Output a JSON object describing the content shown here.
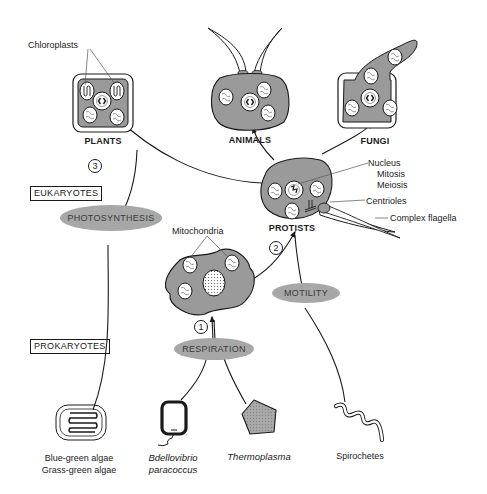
{
  "kingdoms": {
    "plants": "PLANTS",
    "animals": "ANIMALS",
    "fungi": "FUNGI",
    "protists": "PROTISTS"
  },
  "domains": {
    "eukaryotes": "EUKARYOTES",
    "prokaryotes": "PROKARYOTES"
  },
  "processes": {
    "photosynthesis": "PHOTOSYNTHESIS",
    "respiration": "RESPIRATION",
    "motility": "MOTILITY"
  },
  "steps": [
    "1",
    "2",
    "3"
  ],
  "organelle_labels": {
    "chloroplasts": "Chloroplasts",
    "mitochondria": "Mitochondria",
    "nucleus": "Nucleus",
    "mitosis": "Mitosis",
    "meiosis": "Meiosis",
    "centrioles": "Centrioles",
    "complex_flagella": "Complex flagella"
  },
  "prokaryotes": [
    {
      "name_line1": "Blue-green algae",
      "name_line2": "Grass-green algae",
      "italic": false
    },
    {
      "name_line1": "Bdellovibrio",
      "name_line2": "paracoccus",
      "italic": true
    },
    {
      "name_line1": "Thermoplasma",
      "name_line2": "",
      "italic": true
    },
    {
      "name_line1": "Spirochetes",
      "name_line2": "",
      "italic": false
    }
  ],
  "colors": {
    "cell_fill": "#9a9a9a",
    "pill_fill": "#a7a7a7",
    "ink": "#1a1a1a",
    "paper": "#ffffff"
  }
}
